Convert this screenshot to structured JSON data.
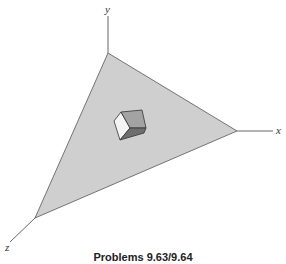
{
  "figure": {
    "axes": {
      "x_label": "x",
      "y_label": "y",
      "z_label": "z"
    },
    "plane": {
      "fill": "#cfcfcf",
      "stroke": "#555555"
    },
    "cube": {
      "front_face": "#f4f4f4",
      "top_face": "#a9a9a9",
      "side_face": "#8a8a8a",
      "bottom_face": "#6e6e6e"
    },
    "caption": "Problems 9.63/9.64"
  }
}
